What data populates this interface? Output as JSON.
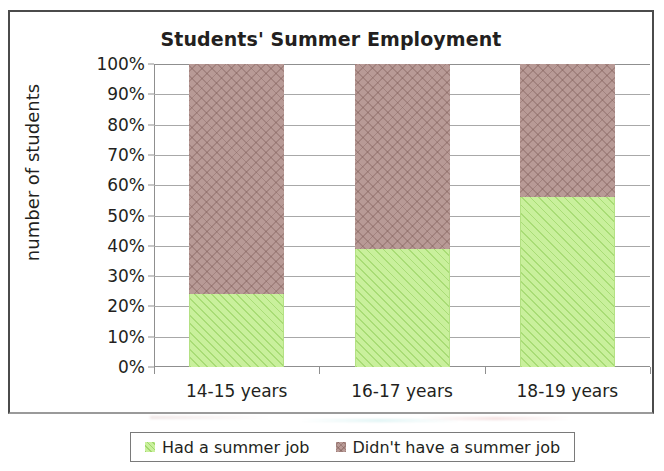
{
  "chart_data": {
    "type": "bar",
    "subtype": "stacked-percent",
    "title": "Students' Summer Employment",
    "xlabel": "",
    "ylabel": "number of students",
    "categories": [
      "14-15 years",
      "16-17 years",
      "18-19 years"
    ],
    "series": [
      {
        "name": "Had a summer job",
        "color": "#c9f09c",
        "values": [
          24,
          39,
          56
        ]
      },
      {
        "name": "Didn't have a summer job",
        "color": "#b89a96",
        "values": [
          76,
          61,
          44
        ]
      }
    ],
    "ylim": [
      0,
      100
    ],
    "ytick_labels": [
      "100%",
      "90%",
      "80%",
      "70%",
      "60%",
      "50%",
      "40%",
      "30%",
      "20%",
      "10%",
      "0%"
    ],
    "ytick_values": [
      100,
      90,
      80,
      70,
      60,
      50,
      40,
      30,
      20,
      10,
      0
    ],
    "grid": true,
    "legend_position": "bottom"
  },
  "legend": {
    "entries": [
      {
        "label": "Had a summer job"
      },
      {
        "label": "Didn't have a summer job"
      }
    ]
  }
}
